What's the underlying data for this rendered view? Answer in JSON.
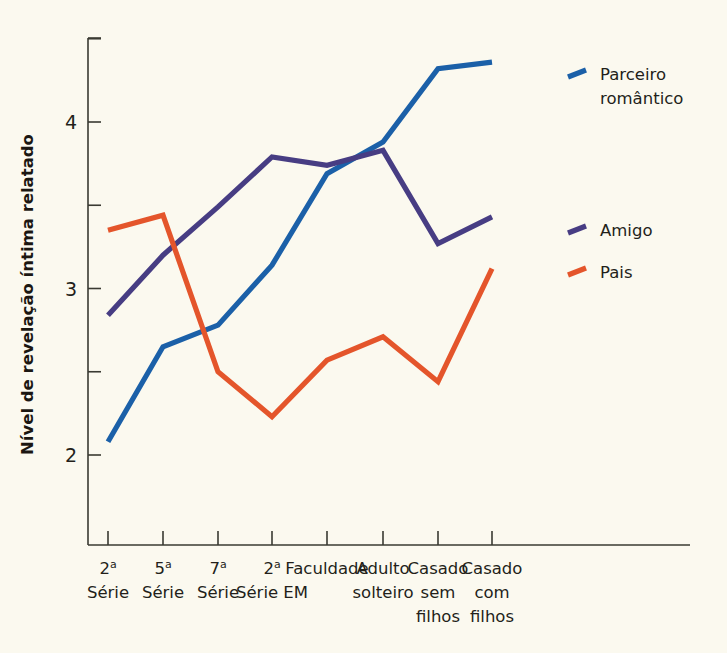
{
  "figure": {
    "background_color": "#fbf9ef",
    "axis_color": "#3a3a32",
    "text_color": "#231f1a"
  },
  "axes": {
    "y_title": "Nível de revelação íntima relatado",
    "y_tick_labels": [
      "2",
      "3",
      "4"
    ],
    "y_minor_ticks": [
      "2.5",
      "3.5",
      "4.5"
    ]
  },
  "legend": {
    "entries": [
      {
        "label_line1": "Parceiro",
        "label_line2": "romântico",
        "color": "#1b60a8"
      },
      {
        "label_line1": "Amigo",
        "label_line2": "",
        "color": "#473d83"
      },
      {
        "label_line1": "Pais",
        "label_line2": "",
        "color": "#e4552b"
      }
    ]
  },
  "chart_data": {
    "type": "line",
    "title": "",
    "xlabel": "",
    "ylabel": "Nível de revelação íntima relatado",
    "ylim": [
      1.75,
      4.55
    ],
    "yticks": [
      2,
      2.5,
      3,
      3.5,
      4,
      4.5
    ],
    "ytick_labels": [
      "2",
      "",
      "3",
      "",
      "4",
      ""
    ],
    "grid": false,
    "legend_position": "right",
    "categories": [
      "2ª Série",
      "5ª Série",
      "7ª Série",
      "2ª Série EM",
      "Faculdade",
      "Adulto solteiro",
      "Casado sem filhos",
      "Casado com filhos"
    ],
    "categories_lines": [
      [
        "2ª",
        "Série"
      ],
      [
        "5ª",
        "Série"
      ],
      [
        "7ª",
        "Série"
      ],
      [
        "2ª",
        "Série EM"
      ],
      [
        "Faculdade"
      ],
      [
        "Adulto",
        "solteiro"
      ],
      [
        "Casado",
        "sem",
        "filhos"
      ],
      [
        "Casado",
        "com",
        "filhos"
      ]
    ],
    "series": [
      {
        "name": "Parceiro romântico",
        "color": "#1b60a8",
        "values": [
          2.08,
          2.65,
          2.78,
          3.14,
          3.69,
          3.88,
          4.32,
          4.36
        ]
      },
      {
        "name": "Amigo",
        "color": "#473d83",
        "values": [
          2.84,
          3.2,
          3.49,
          3.79,
          3.74,
          3.83,
          3.27,
          3.43
        ]
      },
      {
        "name": "Pais",
        "color": "#e4552b",
        "values": [
          3.35,
          3.44,
          2.5,
          2.23,
          2.57,
          2.71,
          2.44,
          3.12
        ]
      }
    ]
  }
}
